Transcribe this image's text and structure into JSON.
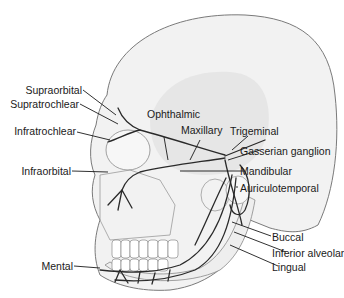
{
  "figure": {
    "colors": {
      "skull_fill": "#f2f2f2",
      "skull_shade": "#e3e3e3",
      "outline": "#7a7a7a",
      "nerve": "#2a2a2a",
      "leader_line": "#1a1a1a",
      "text": "#1a1a1a"
    }
  },
  "labels": {
    "supraorbital": "Supraorbital",
    "supratrochlear": "Supratrochlear",
    "infratrochlear": "Infratrochlear",
    "infraorbital": "Infraorbital",
    "mental": "Mental",
    "ophthalmic": "Ophthalmic",
    "maxillary": "Maxillary",
    "trigeminal": "Trigeminal",
    "gasserian_ganglion": "Gasserian ganglion",
    "mandibular": "Mandibular",
    "auriculotemporal": "Auriculotemporal",
    "buccal": "Buccal",
    "inferior_alveolar": "Inferior alveolar",
    "lingual": "Lingual"
  }
}
